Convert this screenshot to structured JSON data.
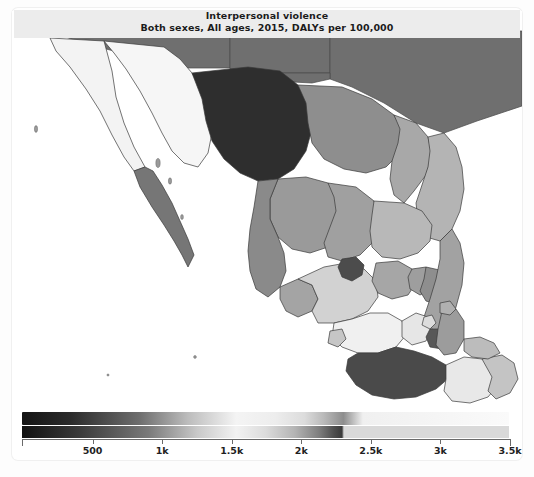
{
  "figure": {
    "title": "Interpersonal violence",
    "subtitle": "Both sexes, All ages, 2015, DALYs per 100,000",
    "footnote": ""
  },
  "chart_data": {
    "type": "heatmap",
    "title": "Interpersonal violence",
    "subtitle": "Both sexes, All ages, 2015, DALYs per 100,000",
    "xlabel": "",
    "ylabel": "",
    "measure": "DALYs per 100,000",
    "cause": "Interpersonal violence",
    "sex": "Both sexes",
    "age": "All ages",
    "year": 2015,
    "region": "Mexico (states) and southern United States",
    "grid": false,
    "legend_position": "bottom",
    "colorbar": {
      "orientation": "horizontal",
      "min": 0,
      "max": 3500,
      "tick_values": [
        500,
        1000,
        1500,
        2000,
        2500,
        3000,
        3500
      ],
      "tick_labels": [
        "500",
        "1k",
        "1.5k",
        "2k",
        "2.5k",
        "3k",
        "3.5k"
      ],
      "low_color": "#111111",
      "mid_color": "#f2f2f2",
      "high_color": "#3a3a3a",
      "no_data_color": "#6f6f6f",
      "saturation_point": 2300
    },
    "categories": [
      "Chihuahua",
      "Guerrero",
      "Sinaloa",
      "Baja California Sur",
      "Colima",
      "Michoacan",
      "Morelos",
      "Zacatecas",
      "Durango",
      "Nayarit",
      "Coahuila",
      "Tamaulipas",
      "Sonora",
      "Nuevo Leon",
      "San Luis Potosi",
      "Jalisco",
      "Guanajuato",
      "Aguascalientes",
      "Queretaro",
      "Baja California",
      "Veracruz",
      "Mexico",
      "Distrito Federal",
      "Puebla",
      "Tlaxcala",
      "Hidalgo"
    ],
    "values": [
      3200,
      3100,
      2600,
      2200,
      2100,
      2050,
      2000,
      1700,
      1650,
      1600,
      1550,
      1500,
      900,
      1400,
      1350,
      900,
      850,
      800,
      780,
      1900,
      1100,
      1500,
      1200,
      700,
      650,
      900
    ],
    "series": [
      {
        "name": "DALYs per 100,000",
        "values": [
          3200,
          3100,
          2600,
          2200,
          2100,
          2050,
          2000,
          1700,
          1650,
          1600,
          1550,
          1500,
          900,
          1400,
          1350,
          900,
          850,
          800,
          780,
          1900,
          1100,
          1500,
          1200,
          700,
          650,
          900
        ]
      }
    ]
  }
}
